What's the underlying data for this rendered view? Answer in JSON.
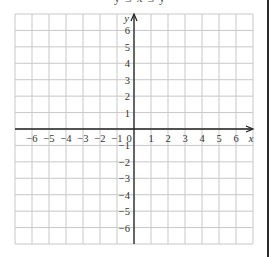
{
  "header": {
    "clipped_text": "y ≤ x ≤ y"
  },
  "grid": {
    "x_min": -7,
    "x_max": 7,
    "y_min": -7,
    "y_max": 7,
    "origin_label": "0",
    "x_axis_label": "x",
    "y_axis_label": "y",
    "x_tick_labels": [
      "−6",
      "−5",
      "−4",
      "−3",
      "−2",
      "−1",
      "1",
      "2",
      "3",
      "4",
      "5",
      "6"
    ],
    "x_tick_values": [
      -6,
      -5,
      -4,
      -3,
      -2,
      -1,
      1,
      2,
      3,
      4,
      5,
      6
    ],
    "y_tick_labels": [
      "6",
      "5",
      "4",
      "3",
      "2",
      "1",
      "−1",
      "−2",
      "−3",
      "−4",
      "−5",
      "−6"
    ],
    "y_tick_values": [
      6,
      5,
      4,
      3,
      2,
      1,
      -1,
      -2,
      -3,
      -4,
      -5,
      -6
    ],
    "colors": {
      "grid_line": "#c8c8c8",
      "axis": "#222222",
      "label": "#333333"
    }
  }
}
